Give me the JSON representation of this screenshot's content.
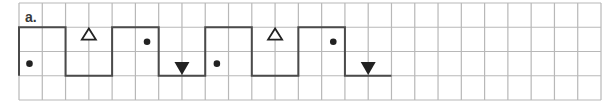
{
  "exercise": {
    "label": "a.",
    "grid": {
      "columns": 25,
      "rows": 4
    },
    "colors": {
      "grid_line": "#b8b8b8",
      "path_line": "#4a4a4a",
      "marker": "#222222",
      "background": "#ffffff"
    },
    "path": {
      "description": "square-wave path along grid lines",
      "points": [
        [
          0,
          3
        ],
        [
          0,
          1
        ],
        [
          2,
          1
        ],
        [
          2,
          3
        ],
        [
          4,
          3
        ],
        [
          4,
          1
        ],
        [
          6,
          1
        ],
        [
          6,
          3
        ],
        [
          8,
          3
        ],
        [
          8,
          1
        ],
        [
          10,
          1
        ],
        [
          10,
          3
        ],
        [
          12,
          3
        ],
        [
          12,
          1
        ],
        [
          14,
          1
        ],
        [
          14,
          3
        ],
        [
          16,
          3
        ]
      ]
    },
    "markers": [
      {
        "type": "dot",
        "col": 0.45,
        "row": 2.5
      },
      {
        "type": "hollow-triangle-up",
        "col": 3,
        "row": 1.3
      },
      {
        "type": "dot",
        "col": 5.5,
        "row": 1.6
      },
      {
        "type": "filled-triangle-down",
        "col": 7,
        "row": 2.7
      },
      {
        "type": "dot",
        "col": 8.5,
        "row": 2.5
      },
      {
        "type": "hollow-triangle-up",
        "col": 11,
        "row": 1.3
      },
      {
        "type": "dot",
        "col": 13.5,
        "row": 1.6
      },
      {
        "type": "filled-triangle-down",
        "col": 15,
        "row": 2.7
      }
    ]
  }
}
